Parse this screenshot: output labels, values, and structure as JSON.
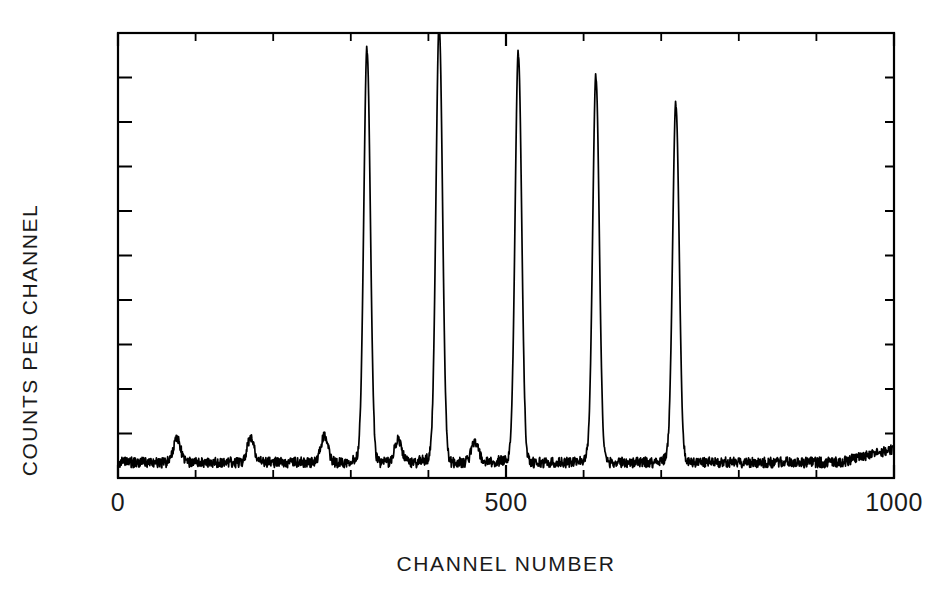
{
  "figure": {
    "background_color": "#ffffff",
    "line_color": "#000000",
    "axis_color": "#000000"
  },
  "axes": {
    "x_title": "CHANNEL NUMBER",
    "y_title": "COUNTS PER CHANNEL",
    "x_tick_labels": [
      "0",
      "500",
      "1000"
    ],
    "x_tick_values": [
      0,
      500,
      1000
    ],
    "y_tick_labels": [],
    "x_minor_tick_interval": 100,
    "y_minor_tick_count": 11,
    "frame": {
      "left": 118,
      "right": 894,
      "top": 33,
      "bottom": 478
    },
    "grid": false,
    "legend": false
  },
  "chart_data": {
    "type": "line",
    "title": "",
    "subtitle": "",
    "xlabel": "CHANNEL NUMBER",
    "ylabel": "COUNTS PER CHANNEL",
    "xlim": [
      0,
      1000
    ],
    "ylim": [
      0,
      1.0
    ],
    "xticks": [
      0,
      500,
      1000
    ],
    "xticklabels": [
      "0",
      "500",
      "1000"
    ],
    "yticks": [],
    "yticklabels": [],
    "grid": false,
    "legend_position": "none",
    "annotations": [],
    "series": [
      {
        "name": "gamma spectrum",
        "description": "Pulse-height spectrum: narrow full-energy photopeaks on a low flat continuum background.",
        "baseline_level": 0.035,
        "noise_amplitude": 0.012,
        "peaks": [
          {
            "label": "minor-1",
            "channel": 76,
            "height": 0.055,
            "width": 4.5
          },
          {
            "label": "minor-2",
            "channel": 171,
            "height": 0.055,
            "width": 4.5
          },
          {
            "label": "minor-3",
            "channel": 266,
            "height": 0.06,
            "width": 4.5
          },
          {
            "label": "major-1",
            "channel": 321,
            "height": 0.922,
            "width": 4.2
          },
          {
            "label": "minor-4",
            "channel": 361,
            "height": 0.052,
            "width": 4.5
          },
          {
            "label": "major-2",
            "channel": 414,
            "height": 0.976,
            "width": 4.2
          },
          {
            "label": "minor-5",
            "channel": 460,
            "height": 0.048,
            "width": 4.5
          },
          {
            "label": "major-3",
            "channel": 516,
            "height": 0.913,
            "width": 4.2
          },
          {
            "label": "major-4",
            "channel": 616,
            "height": 0.861,
            "width": 4.2
          },
          {
            "label": "major-5",
            "channel": 719,
            "height": 0.8,
            "width": 4.2
          }
        ]
      }
    ]
  }
}
